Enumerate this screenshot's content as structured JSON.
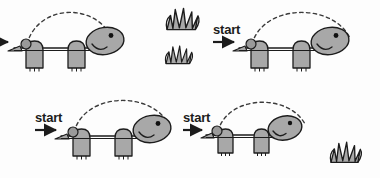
{
  "image": {
    "title": "Turtle ball-launch trajectory sequence",
    "width": 380,
    "height": 178,
    "background_color": "#fdfdfd",
    "panel_count": 4
  },
  "palette": {
    "outline": "#1c1c1c",
    "body_fill": "#a8a8a8",
    "body_fill_light": "#b5b5b5",
    "shell_line": "#1c1c1c",
    "ball_fill": "#9a9a9a",
    "grass_fill": "#a8a8a8",
    "eye": "#111111",
    "arc_dash": "#3a3a3a",
    "text": "#1c1c1c"
  },
  "labels": {
    "start_full": "start",
    "start_clipped": "rt"
  },
  "panels": [
    {
      "id": "panel-top-left",
      "position": "top-left",
      "start_label": "rt",
      "start_label_clipped": true,
      "arrow_visible": true,
      "ball_visible": true,
      "arc_visible": true,
      "arc_style": "dashed",
      "turtle_facing": "right",
      "grass_count": 0
    },
    {
      "id": "panel-top-right",
      "position": "top-right",
      "start_label": "start",
      "start_label_clipped": false,
      "arrow_visible": true,
      "ball_visible": true,
      "arc_visible": true,
      "arc_style": "dashed",
      "turtle_facing": "right",
      "grass_count": 0
    },
    {
      "id": "panel-bottom-left",
      "position": "bottom-left",
      "start_label": "start",
      "start_label_clipped": false,
      "arrow_visible": true,
      "ball_visible": true,
      "arc_visible": true,
      "arc_style": "dashed",
      "turtle_facing": "right",
      "grass_count": 0
    },
    {
      "id": "panel-bottom-right",
      "position": "bottom-right",
      "start_label": "start",
      "start_label_clipped": false,
      "arrow_visible": true,
      "ball_visible": true,
      "arc_visible": true,
      "arc_style": "dashed",
      "turtle_facing": "right",
      "grass_count": 1
    }
  ],
  "decorations": {
    "grass_tufts": [
      {
        "id": "grass-top-upper",
        "location": "top-center-upper",
        "size": "large"
      },
      {
        "id": "grass-top-lower",
        "location": "top-center-lower",
        "size": "small"
      },
      {
        "id": "grass-bottom-right",
        "location": "bottom-right-of-turtle",
        "size": "medium"
      }
    ]
  }
}
